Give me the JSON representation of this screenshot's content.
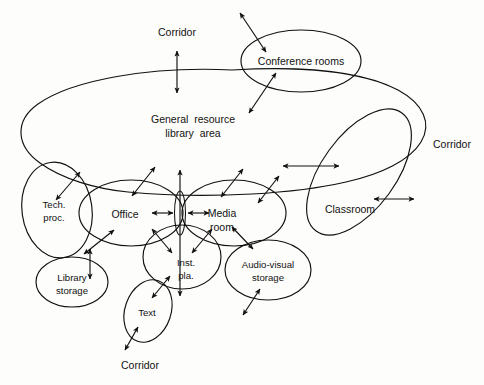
{
  "diagram": {
    "type": "bubble-adjacency-diagram",
    "title_text_present": false,
    "background_color": "#fdfdfb",
    "line_color": "#111111",
    "text_color": "#121212",
    "regions": [
      {
        "id": "general-resource-library-area",
        "label_line1": "General  resource",
        "label_line2": "library  area",
        "shape": "large-irregular-blob"
      },
      {
        "id": "conference-rooms",
        "label_line1": "Conference rooms",
        "label_line2": "",
        "shape": "ellipse"
      },
      {
        "id": "classroom",
        "label_line1": "Classroom",
        "label_line2": "",
        "shape": "tilted-ellipse"
      },
      {
        "id": "tech-proc",
        "label_line1": "Tech.",
        "label_line2": "proc.",
        "shape": "ellipse"
      },
      {
        "id": "office",
        "label_line1": "Office",
        "label_line2": "",
        "shape": "ellipse"
      },
      {
        "id": "media-room",
        "label_line1": "Media",
        "label_line2": "room",
        "shape": "ellipse"
      },
      {
        "id": "library-storage",
        "label_line1": "Library",
        "label_line2": "storage",
        "shape": "ellipse"
      },
      {
        "id": "inst-pla",
        "label_line1": "Inst.",
        "label_line2": "pla.",
        "shape": "ellipse"
      },
      {
        "id": "audio-visual-storage",
        "label_line1": "Audio-visual",
        "label_line2": "storage",
        "shape": "ellipse"
      },
      {
        "id": "text",
        "label_line1": "Text",
        "label_line2": "",
        "shape": "tilted-ellipse"
      },
      {
        "id": "center-node",
        "label_line1": "",
        "label_line2": "",
        "shape": "narrow-vertical-lens"
      }
    ],
    "edge_labels": [
      {
        "id": "corridor-top",
        "text": "Corridor"
      },
      {
        "id": "corridor-right",
        "text": "Corridor"
      },
      {
        "id": "corridor-bottom",
        "text": "Corridor"
      }
    ]
  }
}
